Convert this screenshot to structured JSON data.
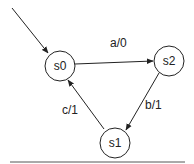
{
  "diagram": {
    "type": "state-machine",
    "nodes": [
      {
        "id": "s0",
        "label": "s0",
        "initial": true
      },
      {
        "id": "s2",
        "label": "s2"
      },
      {
        "id": "s1",
        "label": "s1"
      }
    ],
    "edges": [
      {
        "from": "s0",
        "to": "s2",
        "label": "a/0"
      },
      {
        "from": "s2",
        "to": "s1",
        "label": "b/1"
      },
      {
        "from": "s1",
        "to": "s0",
        "label": "c/1"
      }
    ],
    "colors": {
      "stroke": "#222222",
      "background": "#ffffff"
    }
  }
}
